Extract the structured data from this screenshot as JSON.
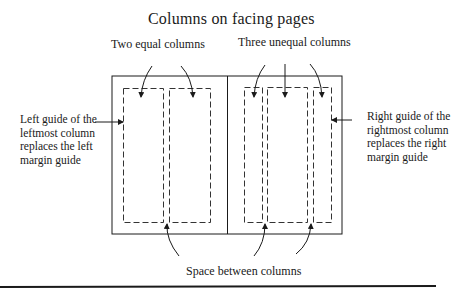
{
  "diagram": {
    "title": "Columns on facing pages",
    "labels": {
      "two_equal": "Two equal columns",
      "three_unequal": "Three unequal columns",
      "left_guide": "Left guide of the leftmost column replaces the left margin guide",
      "right_guide": "Right guide of the rightmost column replaces the right margin guide",
      "space_between": "Space between columns"
    },
    "pages": [
      {
        "name": "left-page",
        "columns": 2,
        "column_type": "equal"
      },
      {
        "name": "right-page",
        "columns": 3,
        "column_type": "unequal"
      }
    ],
    "colors": {
      "line": "#1a1a1a",
      "dash": "#333333",
      "background": "#ffffff"
    }
  }
}
